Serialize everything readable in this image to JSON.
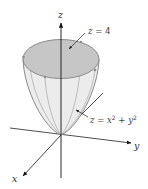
{
  "diagram": {
    "type": "3d-surface-plot",
    "axes": {
      "x": {
        "label": "x"
      },
      "y": {
        "label": "y"
      },
      "z": {
        "label": "z"
      }
    },
    "annotations": {
      "top_plane": {
        "var": "z",
        "op": "=",
        "value": "4"
      },
      "surface": {
        "lhs": "z",
        "op": "=",
        "t1": "x",
        "plus": "+",
        "t2": "y",
        "exp": "2"
      }
    },
    "colors": {
      "top_disk": "#c8c8c8",
      "surface_fill": "#e9e9e9",
      "surface_edge": "#8a8a8a",
      "axis": "#111111"
    }
  }
}
